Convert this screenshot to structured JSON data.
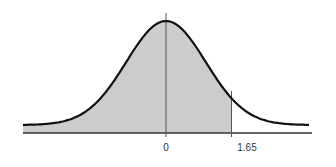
{
  "chart_data": {
    "type": "area",
    "title": "",
    "xlabel": "",
    "ylabel": "",
    "distribution": "standard normal",
    "xlim": [
      -3.6,
      3.6
    ],
    "shaded_region": {
      "from": -3.6,
      "to": 1.65,
      "color": "#cccccc"
    },
    "markers": [
      {
        "x": 0,
        "label": "0"
      },
      {
        "x": 1.65,
        "label": "1.65"
      }
    ],
    "tick_labels": [
      "0",
      "1.65"
    ],
    "grid": false,
    "legend": null
  },
  "colors": {
    "curve": "#111111",
    "fill": "#cccccc",
    "axis": "#333333",
    "marker_line": "#555555"
  },
  "labels": {
    "zero": "0",
    "critical": "1.65"
  }
}
